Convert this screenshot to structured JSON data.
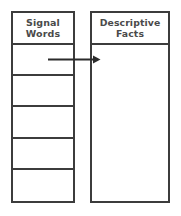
{
  "diagram": {
    "type": "two-column-graphic-organizer",
    "columns": [
      {
        "id": "signal-words",
        "header": "Signal Words",
        "header_line1": "Signal",
        "header_line2": "Words",
        "row_count": 5,
        "rows": [
          "",
          "",
          "",
          "",
          ""
        ]
      },
      {
        "id": "descriptive-facts",
        "header": "Descriptive Facts",
        "header_line1": "Descriptive",
        "header_line2": "Facts",
        "row_count": 1,
        "rows": [
          ""
        ]
      }
    ],
    "connector": {
      "name": "arrow-right",
      "from": "signal-words-row-1",
      "to": "descriptive-facts-body",
      "direction": "right"
    },
    "colors": {
      "border": "#3c3c3c",
      "text": "#4a4a4a",
      "background": "#ffffff",
      "arrow": "#2b2b2b"
    }
  }
}
